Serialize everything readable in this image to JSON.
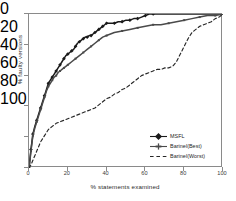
{
  "chart_data": {
    "type": "line",
    "title": "",
    "xlabel": "% statements examined",
    "ylabel": "% faulty versions",
    "xlim": [
      0,
      100
    ],
    "ylim": [
      0,
      100
    ],
    "xticks": [
      0,
      20,
      40,
      60,
      80,
      100
    ],
    "yticks": [
      0,
      20,
      40,
      60,
      80,
      100
    ],
    "grid": false,
    "legend_position": "lower right",
    "series": [
      {
        "name": "MSFL",
        "color": "#1a1a1a",
        "linestyle": "solid",
        "marker": "diamond",
        "x": [
          0,
          0.5,
          1,
          1.5,
          2,
          3,
          4,
          5,
          6,
          7,
          8,
          9,
          10,
          11,
          12,
          13,
          14,
          15,
          16,
          17,
          18,
          19,
          20,
          21,
          22,
          23,
          24,
          25,
          26,
          27,
          28,
          29,
          30,
          31,
          32,
          33,
          34,
          35,
          36,
          37,
          38,
          39,
          40,
          42,
          44,
          46,
          48,
          50,
          52,
          54,
          56,
          58,
          60,
          62,
          64,
          100
        ],
        "y": [
          0,
          6,
          12,
          17,
          22,
          27,
          31,
          35,
          39,
          43,
          47,
          51,
          55,
          57,
          59,
          61,
          63,
          65,
          67,
          69,
          71,
          73,
          74,
          75,
          76,
          77,
          79,
          81,
          82,
          83,
          84,
          85,
          85,
          86,
          86,
          87,
          88,
          89,
          90,
          91,
          92,
          93,
          94,
          94,
          94,
          95,
          95,
          96,
          96,
          97,
          97,
          98,
          99,
          100,
          100,
          100
        ]
      },
      {
        "name": "Barinel(Best)",
        "color": "#4a4a4a",
        "linestyle": "solid",
        "marker": "plus",
        "x": [
          0,
          0.5,
          1,
          1.5,
          2,
          3,
          4,
          5,
          6,
          7,
          8,
          9,
          10,
          11,
          12,
          13,
          14,
          15,
          16,
          17,
          18,
          19,
          20,
          22,
          24,
          26,
          28,
          30,
          32,
          34,
          36,
          38,
          40,
          44,
          48,
          52,
          56,
          60,
          64,
          68,
          72,
          76,
          80,
          84,
          88,
          92,
          96,
          100
        ],
        "y": [
          0,
          5,
          11,
          16,
          21,
          26,
          30,
          34,
          38,
          42,
          46,
          50,
          53,
          55,
          57,
          59,
          60,
          62,
          63,
          64,
          65,
          66,
          67,
          69,
          71,
          73,
          75,
          77,
          79,
          81,
          83,
          85,
          86,
          88,
          89,
          90,
          91,
          92,
          93,
          93,
          94,
          95,
          96,
          97,
          98,
          99,
          99,
          100
        ]
      },
      {
        "name": "Barinel(Worst)",
        "color": "#262626",
        "linestyle": "dashed",
        "marker": "none",
        "x": [
          0,
          1,
          2,
          3,
          4,
          5,
          6,
          7,
          8,
          9,
          10,
          12,
          14,
          16,
          18,
          20,
          22,
          24,
          26,
          28,
          30,
          32,
          34,
          36,
          38,
          40,
          42,
          44,
          46,
          48,
          50,
          52,
          54,
          56,
          58,
          60,
          62,
          64,
          66,
          68,
          70,
          72,
          74,
          76,
          78,
          80,
          82,
          84,
          86,
          88,
          90,
          92,
          94,
          96,
          98,
          100
        ],
        "y": [
          0,
          2,
          5,
          8,
          11,
          14,
          17,
          19,
          21,
          23,
          25,
          27,
          29,
          30,
          31,
          32,
          33,
          34,
          35,
          36,
          37,
          38,
          39,
          41,
          43,
          45,
          46,
          48,
          49,
          51,
          52,
          54,
          56,
          58,
          60,
          61,
          62,
          63,
          64,
          64,
          65,
          65,
          66,
          69,
          74,
          79,
          84,
          88,
          90,
          92,
          93,
          94,
          95,
          97,
          98,
          100
        ]
      }
    ]
  },
  "axes": {
    "xlabel": "% statements examined",
    "ylabel": "% faulty versions",
    "xticks": [
      "0",
      "20",
      "40",
      "60",
      "80",
      "100"
    ],
    "yticks": [
      "0",
      "20",
      "40",
      "60",
      "80",
      "100"
    ]
  },
  "legend": {
    "entries": [
      {
        "label": "MSFL"
      },
      {
        "label": "Barinel(Best)"
      },
      {
        "label": "Barinel(Worst)"
      }
    ]
  }
}
